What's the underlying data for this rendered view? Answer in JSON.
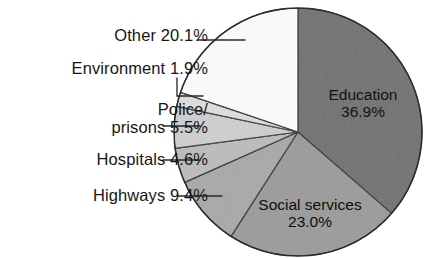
{
  "chart_data": {
    "type": "pie",
    "title": "",
    "subtitle": "",
    "xlabel": "",
    "ylabel": "",
    "legend_position": "none",
    "grid": false,
    "start_angle_deg": 0,
    "direction": "clockwise",
    "unit": "%",
    "categories": [
      "Education",
      "Social services",
      "Highways",
      "Hospitals",
      "Police/prisons",
      "Environment",
      "Other"
    ],
    "values": [
      36.9,
      23.0,
      9.4,
      4.6,
      5.5,
      1.9,
      20.1
    ],
    "slices": [
      {
        "name": "Education",
        "value": 36.9,
        "label_line1": "Education",
        "label_line2": "36.9%",
        "label_placement": "inside",
        "fill": "#6e6e6e"
      },
      {
        "name": "Social services",
        "value": 23.0,
        "label_line1": "Social services",
        "label_line2": "23.0%",
        "label_placement": "inside",
        "fill": "#9a9a9a"
      },
      {
        "name": "Highways",
        "value": 9.4,
        "label_line1": "Highways 9.4%",
        "label_line2": "",
        "label_placement": "outside-left",
        "fill": "#a8a8a8"
      },
      {
        "name": "Hospitals",
        "value": 4.6,
        "label_line1": "Hospitals 4.6%",
        "label_line2": "",
        "label_placement": "outside-left",
        "fill": "#bcbcbc"
      },
      {
        "name": "Police/prisons",
        "value": 5.5,
        "label_line1": "Police/",
        "label_line2": "prisons 5.5%",
        "label_placement": "outside-left",
        "fill": "#cfcfcf"
      },
      {
        "name": "Environment",
        "value": 1.9,
        "label_line1": "Environment 1.9%",
        "label_line2": "",
        "label_placement": "outside-left",
        "fill": "#dedede"
      },
      {
        "name": "Other",
        "value": 20.1,
        "label_line1": "Other 20.1%",
        "label_line2": "",
        "label_placement": "outside-left",
        "fill": "#fdfdfd"
      }
    ]
  },
  "labels": {
    "other": "Other 20.1%",
    "environment": "Environment 1.9%",
    "police_line1": "Police/",
    "police_line2": "prisons 5.5%",
    "hospitals": "Hospitals 4.6%",
    "highways": "Highways 9.4%",
    "education_line1": "Education",
    "education_line2": "36.9%",
    "social_line1": "Social services",
    "social_line2": "23.0%"
  },
  "colors": {
    "background": "#ffffff",
    "outline": "#2b2b2b",
    "leader_line": "#2b2b2b",
    "education": "#6e6e6e",
    "social_services": "#9a9a9a",
    "highways": "#a8a8a8",
    "hospitals": "#bcbcbc",
    "police_prisons": "#cfcfcf",
    "environment": "#dedede",
    "other": "#fdfdfd"
  }
}
